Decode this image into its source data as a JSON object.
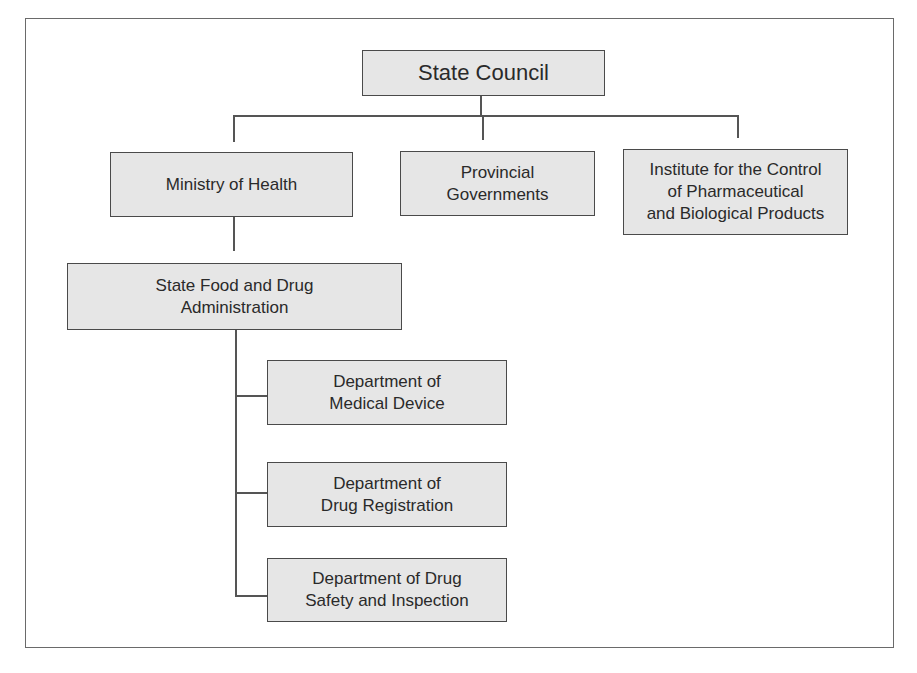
{
  "diagram": {
    "type": "org-chart",
    "colors": {
      "box_face": "#e6e6e6",
      "box_top": "#c9c9c9",
      "box_side": "#bdbdbd",
      "line": "#555555",
      "border": "#4a4a4a"
    },
    "nodes": {
      "state_council": {
        "label": "State Council"
      },
      "ministry_of_health": {
        "label": "Ministry of Health"
      },
      "provincial_governments": {
        "label": "Provincial\nGovernments"
      },
      "institute": {
        "label": "Institute for the Control\nof Pharmaceutical\nand Biological Products"
      },
      "sfda": {
        "label": "State Food and Drug\nAdministration"
      },
      "dept_medical_device": {
        "label": "Department of\nMedical Device"
      },
      "dept_drug_registration": {
        "label": "Department of\nDrug Registration"
      },
      "dept_drug_safety": {
        "label": "Department of Drug\nSafety and Inspection"
      }
    },
    "edges": [
      [
        "state_council",
        "ministry_of_health"
      ],
      [
        "state_council",
        "provincial_governments"
      ],
      [
        "state_council",
        "institute"
      ],
      [
        "ministry_of_health",
        "sfda"
      ],
      [
        "sfda",
        "dept_medical_device"
      ],
      [
        "sfda",
        "dept_drug_registration"
      ],
      [
        "sfda",
        "dept_drug_safety"
      ]
    ]
  }
}
